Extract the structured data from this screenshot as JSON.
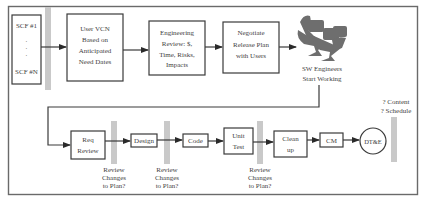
{
  "diagram": {
    "row1": {
      "scf": {
        "top": "SCF #1",
        "dots": [
          "·",
          "·",
          "·"
        ],
        "bottom": "SCF #N"
      },
      "user_vcn": [
        "User VCN",
        "Based on",
        "Anticipated",
        "Need Dates"
      ],
      "eng_review": [
        "Engineering",
        "Review:  $,",
        "Time, Risks,",
        "Impacts"
      ],
      "negotiate": [
        "Negotiate",
        "Release Plan",
        "with Users"
      ],
      "sw_engineers": {
        "icon": "workstations-icon",
        "label": [
          "SW Engineers",
          "Start  Working"
        ]
      }
    },
    "row2": {
      "req_review": [
        "Req",
        "Review"
      ],
      "design": "Design",
      "code": "Code",
      "unit_test": [
        "Unit",
        "Test"
      ],
      "clean_up": [
        "Clean",
        "up"
      ],
      "cm": "CM",
      "dtae": "DT&E",
      "review_gates": [
        [
          "Review",
          "Changes",
          "to Plan?"
        ],
        [
          "Review",
          "Changes",
          "to Plan?"
        ],
        [
          "Review",
          "Changes",
          "to Plan?"
        ]
      ],
      "final_gate": [
        "? Content",
        "? Schedule"
      ]
    }
  },
  "colors": {
    "stroke": "#3a3a3a",
    "gate_bar": "#c9c9c9",
    "frame": "#6a6a6a"
  }
}
